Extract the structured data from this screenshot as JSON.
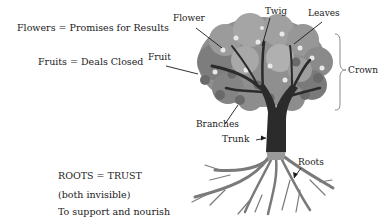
{
  "legend": {
    "flowers": "Flowers = Promises for Results",
    "fruits": "Fruits = Deals Closed",
    "roots_title": "ROOTS = TRUST",
    "roots_note": "(both invisible)",
    "roots_purpose": "To support and nourish"
  },
  "labels": {
    "flower": "Flower",
    "twig": "Twig",
    "leaves": "Leaves",
    "fruit": "Fruit",
    "crown": "Crown",
    "branches": "Branches",
    "trunk": "Trunk",
    "roots": "Roots"
  },
  "colors": {
    "foliage_dark": "#6e6e6e",
    "foliage_mid": "#8f8f8f",
    "foliage_light": "#b5b5b5",
    "blossom": "#e6e6e6",
    "trunk": "#2b2b2b",
    "roots": "#7a7a7a",
    "text": "#1a1a1a"
  }
}
